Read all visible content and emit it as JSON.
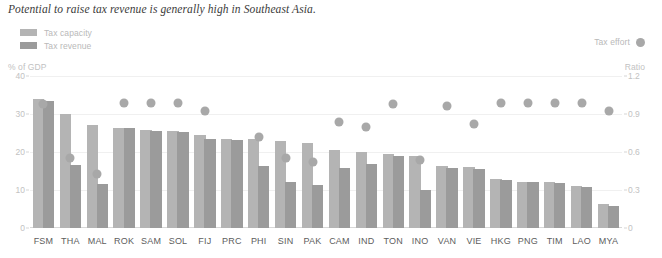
{
  "chart_data": {
    "type": "bar",
    "title": "Potential to raise tax revenue is generally high in Southeast Asia.",
    "xlabel": "",
    "ylabel": "% of GDP",
    "ylabel_right": "Ratio",
    "ylim": [
      0,
      40
    ],
    "ylim_right": [
      0,
      1.2
    ],
    "yticks": [
      "0",
      "10",
      "20",
      "30",
      "40"
    ],
    "yticks_right": [
      "0",
      "0.3",
      "0.6",
      "0.9",
      "1.2"
    ],
    "grid": true,
    "legend_position": "top-left",
    "categories": [
      "FSM",
      "THA",
      "MAL",
      "ROK",
      "SAM",
      "SOL",
      "FIJ",
      "PRC",
      "PHI",
      "SIN",
      "PAK",
      "CAM",
      "IND",
      "TON",
      "INO",
      "VAN",
      "VIE",
      "HKG",
      "PNG",
      "TIM",
      "LAO",
      "MYA"
    ],
    "series": [
      {
        "name": "Tax capacity",
        "color": "#b4b4b4",
        "values": [
          34.0,
          30.0,
          27.2,
          26.4,
          25.8,
          25.5,
          24.5,
          23.5,
          23.4,
          23.0,
          22.4,
          20.6,
          20.0,
          19.4,
          19.0,
          16.2,
          16.0,
          13.0,
          12.2,
          12.1,
          11.0,
          6.4
        ]
      },
      {
        "name": "Tax revenue",
        "color": "#9b9b9b",
        "values": [
          33.4,
          16.6,
          11.6,
          26.2,
          25.6,
          25.3,
          23.3,
          23.2,
          16.4,
          12.2,
          11.4,
          15.8,
          16.8,
          19.0,
          10.0,
          15.9,
          15.6,
          12.7,
          12.0,
          11.9,
          10.7,
          5.8
        ]
      }
    ],
    "marker_series": {
      "name": "Tax effort",
      "color": "#a8a8a8",
      "values": [
        0.98,
        0.55,
        0.43,
        0.99,
        0.99,
        0.99,
        0.92,
        null,
        0.72,
        0.55,
        0.52,
        0.84,
        0.8,
        0.98,
        0.54,
        0.96,
        0.82,
        0.99,
        0.99,
        0.99,
        0.99,
        0.92
      ]
    }
  },
  "legend_left": [
    {
      "label": "Tax capacity",
      "color": "#b4b4b4"
    },
    {
      "label": "Tax revenue",
      "color": "#9b9b9b"
    }
  ],
  "legend_right": {
    "label": "Tax effort",
    "color": "#a8a8a8"
  },
  "axis": {
    "left_title": "% of GDP",
    "right_title": "Ratio"
  }
}
